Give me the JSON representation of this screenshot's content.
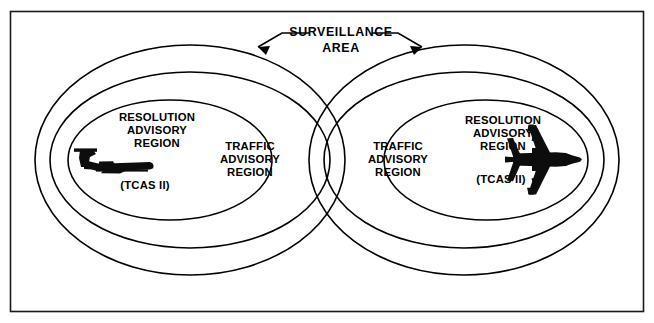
{
  "figure": {
    "kind": "venn-style-diagram",
    "title": {
      "line1": "SURVEILLANCE",
      "line2": "AREA"
    },
    "frame": {
      "border_color": "#1a1a1a",
      "background_color": "#ffffff"
    },
    "stroke_color": "#000000",
    "aircraft_fill": "#0d0d0d"
  },
  "left_cluster": {
    "name": "left-aircraft-cluster",
    "aircraft_view": "side-view-t-tail-jet",
    "inner_region": {
      "line1": "RESOLUTION",
      "line2": "ADVISORY",
      "line3": "REGION",
      "sub": "(TCAS II)"
    },
    "outer_region": {
      "line1": "TRAFFIC",
      "line2": "ADVISORY",
      "line3": "REGION"
    }
  },
  "right_cluster": {
    "name": "right-aircraft-cluster",
    "aircraft_view": "top-view-four-engine-jet",
    "inner_region": {
      "line1": "RESOLUTION",
      "line2": "ADVISORY",
      "line3": "REGION",
      "sub": "(TCAS II)"
    },
    "outer_region": {
      "line1": "TRAFFIC",
      "line2": "ADVISORY",
      "line3": "REGION"
    }
  }
}
